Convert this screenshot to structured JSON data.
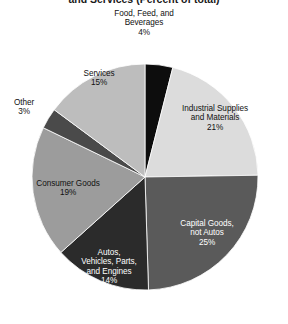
{
  "chart_data": {
    "type": "pie",
    "title": "and Services (Percent of total)",
    "xlabel": "",
    "ylabel": "",
    "legend": "none",
    "grid": false,
    "start_angle_deg": 0,
    "direction": "clockwise",
    "categories": [
      "Food, Feed, and Beverages",
      "Industrial Supplies and Materials",
      "Capital Goods, not Autos",
      "Autos, Vehicles, Parts, and Engines",
      "Consumer Goods",
      "Other",
      "Services"
    ],
    "values": [
      4,
      21,
      25,
      14,
      19,
      3,
      15
    ],
    "value_labels": [
      "4%",
      "21%",
      "25%",
      "14%",
      "19%",
      "3%",
      "15%"
    ],
    "colors": [
      "#0d0d0d",
      "#dcdcdc",
      "#5a5a5a",
      "#2b2b2b",
      "#9c9c9c",
      "#4a4a4a",
      "#bdbdbd"
    ],
    "slices": [
      {
        "label_line1": "Food, Feed, and",
        "label_line2": "Beverages",
        "percent": "4%",
        "color": "#0d0d0d",
        "text_color": "dark",
        "placement": "outside"
      },
      {
        "label_line1": "Industrial Supplies",
        "label_line2": "and Materials",
        "percent": "21%",
        "color": "#dcdcdc",
        "text_color": "dark",
        "placement": "inside"
      },
      {
        "label_line1": "Capital Goods,",
        "label_line2": "not Autos",
        "percent": "25%",
        "color": "#5a5a5a",
        "text_color": "light",
        "placement": "inside"
      },
      {
        "label_line1": "Autos,",
        "label_line2": "Vehicles, Parts,",
        "label_line3": "and Engines",
        "percent": "14%",
        "color": "#2b2b2b",
        "text_color": "light",
        "placement": "inside"
      },
      {
        "label_line1": "Consumer Goods",
        "percent": "19%",
        "color": "#9c9c9c",
        "text_color": "dark",
        "placement": "inside"
      },
      {
        "label_line1": "Other",
        "percent": "3%",
        "color": "#4a4a4a",
        "text_color": "dark",
        "placement": "outside"
      },
      {
        "label_line1": "Services",
        "percent": "15%",
        "color": "#bdbdbd",
        "text_color": "dark",
        "placement": "inside"
      }
    ]
  }
}
